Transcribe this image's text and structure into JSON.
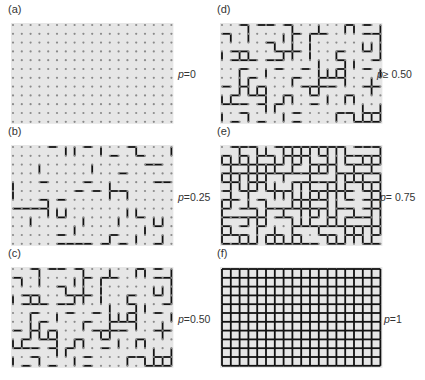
{
  "figure": {
    "grid": {
      "cols": 19,
      "rows": 12,
      "spacing": 8.8
    },
    "colors": {
      "background": "#e6e6e6",
      "node": "#8a8a8a",
      "bond": "#111111"
    },
    "panels": [
      {
        "id": "a",
        "label": "(a)",
        "p_text": "p",
        "p_value": "=0",
        "x": 13,
        "y": 25,
        "label_pos": [
          8,
          3
        ],
        "p_pos": [
          178,
          68
        ]
      },
      {
        "id": "b",
        "label": "(b)",
        "p_text": "p",
        "p_value": "=0.25",
        "x": 13,
        "y": 147,
        "label_pos": [
          8,
          125
        ],
        "p_pos": [
          178,
          191
        ]
      },
      {
        "id": "c",
        "label": "(c)",
        "p_text": "p",
        "p_value": "=0.50",
        "x": 13,
        "y": 269,
        "label_pos": [
          8,
          247
        ],
        "p_pos": [
          178,
          313
        ]
      },
      {
        "id": "d",
        "label": "(d)",
        "p_text": "p",
        "p_value": "≥ 0.50",
        "x": 222,
        "y": 25,
        "label_pos": [
          217,
          3
        ],
        "p_pos": [
          378,
          68
        ]
      },
      {
        "id": "e",
        "label": "(e)",
        "p_text": "p",
        "p_value": "= 0.75",
        "x": 222,
        "y": 147,
        "label_pos": [
          217,
          125
        ],
        "p_pos": [
          382,
          191
        ]
      },
      {
        "id": "f",
        "label": "(f)",
        "p_text": "p",
        "p_value": "=1",
        "x": 222,
        "y": 269,
        "label_pos": [
          217,
          247
        ],
        "p_pos": [
          384,
          313
        ]
      }
    ]
  }
}
